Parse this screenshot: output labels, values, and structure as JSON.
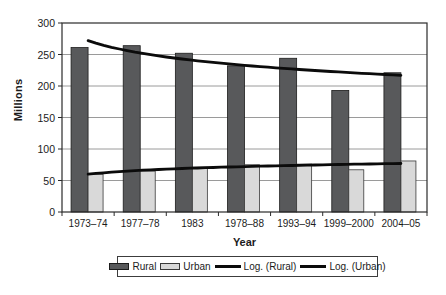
{
  "chart_data": {
    "type": "bar",
    "title": "",
    "categories": [
      "1973–74",
      "1977–78",
      "1983",
      "1978–88",
      "1993–94",
      "1999–2000",
      "2004–05"
    ],
    "series": [
      {
        "name": "Rural",
        "kind": "bar",
        "color": "#58595b",
        "border": "#1c1c1c",
        "values": [
          261,
          264,
          252,
          232,
          244,
          193,
          221
        ]
      },
      {
        "name": "Urban",
        "kind": "bar",
        "color": "#d9d9d9",
        "border": "#3a3a3a",
        "values": [
          60,
          65,
          71,
          75,
          76,
          67,
          81
        ]
      },
      {
        "name": "Log. (Rural)",
        "kind": "log-trendline",
        "source": "Rural",
        "color": "#0b0b0b",
        "start_value": 272,
        "end_value": 217
      },
      {
        "name": "Log. (Urban)",
        "kind": "log-trendline",
        "source": "Urban",
        "color": "#0b0b0b",
        "start_value": 60,
        "end_value": 77
      }
    ],
    "xlabel": "Year",
    "ylabel": "Millions",
    "ylim": [
      0,
      300
    ],
    "ytick_step": 50,
    "yticks": [
      0,
      50,
      100,
      150,
      200,
      250,
      300
    ],
    "grid": true,
    "legend_position": "bottom",
    "colors": {
      "axis": "#2b2b2b",
      "grid": "#9a9a9a",
      "text": "#1c1c1c",
      "background": "#ffffff"
    }
  }
}
